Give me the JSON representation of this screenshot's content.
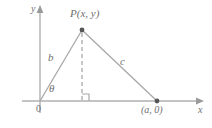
{
  "figure": {
    "background_color": "#ffffff",
    "line_color": "#a8a8a8",
    "axis_color": "#b0b0b0",
    "text_color": "#6f6f6f",
    "point_color": "#555555",
    "axes": {
      "x_axis_label": "x",
      "y_axis_label": "y",
      "origin_label": "0"
    },
    "labels": {
      "point_p": "P(x, y)",
      "side_b": "b",
      "side_c": "c",
      "angle_theta": "θ",
      "point_a": "(a, 0)"
    },
    "points": [
      {
        "name": "P",
        "label": "P(x, y)",
        "px": 82,
        "py": 30
      },
      {
        "name": "A",
        "label": "(a, 0)",
        "px": 157,
        "py": 101
      },
      {
        "name": "O",
        "label": "0",
        "px": 40,
        "py": 101
      }
    ],
    "segments": [
      {
        "name": "side-b",
        "label": "b",
        "from": "O",
        "to": "P",
        "style": "solid"
      },
      {
        "name": "side-c",
        "label": "c",
        "from": "P",
        "to": "A",
        "style": "solid"
      },
      {
        "name": "altitude",
        "label": "",
        "from": "P",
        "to": "foot",
        "style": "dashed"
      }
    ],
    "markers": {
      "right_angle": "right-angle-square",
      "right_angle_px": 82,
      "right_angle_py": 101
    }
  }
}
